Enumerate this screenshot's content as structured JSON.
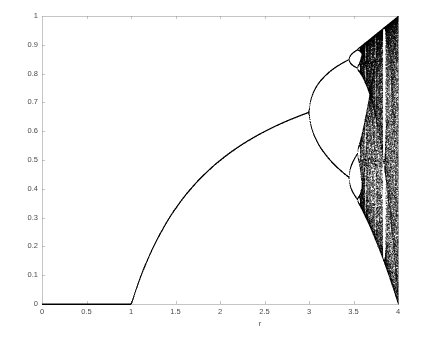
{
  "chart_data": {
    "type": "scatter",
    "title": "",
    "subtitle": "",
    "xlabel": "r",
    "ylabel": "",
    "xlim": [
      0,
      4
    ],
    "ylim": [
      0,
      1
    ],
    "grid": false,
    "legend": null,
    "equation": "x_{n+1} = r x_n (1 - x_n)",
    "x_ticks": [
      0,
      0.5,
      1,
      1.5,
      2,
      2.5,
      3,
      3.5,
      4
    ],
    "x_tick_labels": [
      "0",
      "0.5",
      "1",
      "1.5",
      "2",
      "2.5",
      "3",
      "3.5",
      "4"
    ],
    "y_ticks": [
      0,
      0.1,
      0.2,
      0.3,
      0.4,
      0.5,
      0.6,
      0.7,
      0.8,
      0.9,
      1
    ],
    "y_tick_labels": [
      "0",
      "0.1",
      "0.2",
      "0.3",
      "0.4",
      "0.5",
      "0.6",
      "0.7",
      "0.8",
      "0.9",
      "1"
    ],
    "point_color": "#000000",
    "axis_color": "#8c8c8c",
    "background_color": "#ffffff",
    "r_min": 0,
    "r_max": 4,
    "r_steps": 1400,
    "transient_iterations": 300,
    "plotted_iterations": 260,
    "seed_x0": 0.4,
    "features": [
      {
        "name": "extinction-branch",
        "r_range": [
          0,
          1
        ],
        "x_value": 0,
        "note": "single attractor at x = 0 for r <= 1"
      },
      {
        "name": "fixed-point-branch",
        "r_range": [
          1,
          3
        ],
        "formula": "1 - 1/r",
        "note": "stable non-zero fixed point rising from 0 at r=1 to 0.667 at r=3"
      },
      {
        "name": "period-2-branch",
        "r_range": [
          3,
          3.449
        ],
        "note": "first period doubling at r = 3, x = 0.667"
      },
      {
        "name": "period-4-branch",
        "r_range": [
          3.449,
          3.544
        ],
        "note": "second period doubling near r = 3.45"
      },
      {
        "name": "period-8-branch",
        "r_range": [
          3.544,
          3.564
        ],
        "note": "third period doubling near r = 3.54"
      },
      {
        "name": "onset-of-chaos",
        "r_value": 3.5699,
        "note": "Feigenbaum accumulation point"
      },
      {
        "name": "period-3-window",
        "r_range": [
          3.828,
          3.857
        ],
        "note": "white vertical band in the chaotic region"
      },
      {
        "name": "full-chaos",
        "r_value": 4,
        "x_range": [
          0,
          1
        ],
        "note": "attractor fills the whole unit interval at r = 4"
      }
    ],
    "key_points": [
      {
        "r": 1.0,
        "x": 0.0
      },
      {
        "r": 1.5,
        "x": 0.333
      },
      {
        "r": 2.0,
        "x": 0.5
      },
      {
        "r": 2.5,
        "x": 0.6
      },
      {
        "r": 3.0,
        "x": 0.667
      },
      {
        "r": 3.2,
        "x_values": [
          0.513,
          0.799
        ]
      },
      {
        "r": 3.4,
        "x_values": [
          0.452,
          0.842
        ]
      },
      {
        "r": 3.5,
        "x_values": [
          0.383,
          0.501,
          0.827,
          0.875
        ]
      }
    ]
  },
  "axes": {
    "plot_left_px": 42,
    "plot_right_px": 398,
    "plot_top_px": 16,
    "plot_bottom_px": 304
  }
}
